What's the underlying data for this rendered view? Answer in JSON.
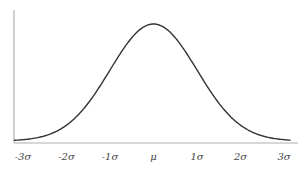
{
  "chart_data": {
    "type": "line",
    "title": "",
    "xlabel": "",
    "ylabel": "",
    "x_ticks": [
      -3,
      -2,
      -1,
      0,
      1,
      2,
      3
    ],
    "tick_labels": [
      "-3σ",
      "-2σ",
      "-1σ",
      "μ",
      "1σ",
      "2σ",
      "3σ"
    ],
    "xlim": [
      -3.2,
      3.25
    ],
    "series": [
      {
        "name": "normal-pdf",
        "function": "exp(-x^2/2)/sqrt(2*pi)",
        "x": [
          -3.2,
          -3,
          -2.5,
          -2,
          -1.5,
          -1,
          -0.5,
          0,
          0.5,
          1,
          1.5,
          2,
          2.5,
          3,
          3.25
        ],
        "y": [
          0.0024,
          0.0044,
          0.0175,
          0.054,
          0.1295,
          0.242,
          0.3521,
          0.3989,
          0.3521,
          0.242,
          0.1295,
          0.054,
          0.0175,
          0.0044,
          0.002
        ]
      }
    ],
    "ylim": [
      0,
      0.4
    ],
    "grid": false,
    "legend": "none",
    "colors": {
      "curve": "#333333",
      "axis": "#b0b0b0"
    }
  }
}
